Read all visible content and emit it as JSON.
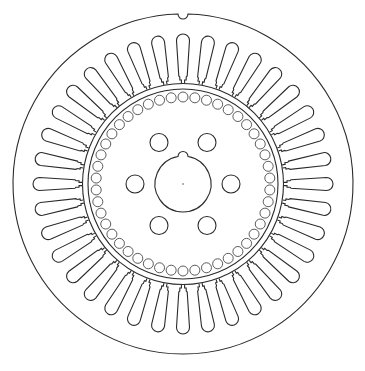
{
  "diagram": {
    "title": "Induction motor stator and rotor lamination cross-section",
    "colors": {
      "stroke": "#2a2a2a",
      "background": "#ffffff"
    },
    "center": [
      183,
      184
    ],
    "outer_frame": {
      "radius": 170,
      "keyway_notch_angle_deg": -90,
      "notch_radius": 5
    },
    "stator": {
      "slot_count": 36,
      "slot_inner_radius": 101,
      "slot_outer_radius": 150,
      "slot_width": 13,
      "bore_radius": 97
    },
    "rotor": {
      "outer_radius": 95,
      "bar_hole_count": 46,
      "bar_hole_radius_position": 87,
      "bar_hole_radius": 5
    },
    "hub": {
      "shaft_radius": 28,
      "key_bump_radius": 5,
      "vent_hole_count": 6,
      "vent_hole_pitch_radius": 48,
      "vent_hole_radius": 9
    }
  }
}
